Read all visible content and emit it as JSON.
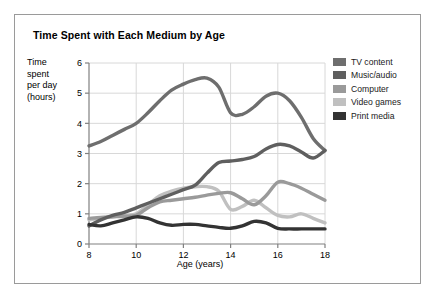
{
  "figure": {
    "title": "Time Spent with Each Medium by Age",
    "border_color": "#9a9a9a",
    "background": "#ffffff"
  },
  "chart_data": {
    "type": "line",
    "title": "Time Spent with Each Medium by Age",
    "xlabel": "Age (years)",
    "ylabel": "Time spent per day (hours)",
    "ylabel_lines": [
      "Time",
      "spent",
      "per day",
      "(hours)"
    ],
    "xlim": [
      8,
      18
    ],
    "ylim": [
      0,
      6
    ],
    "xticks": [
      8,
      10,
      12,
      14,
      16,
      18
    ],
    "yticks": [
      0,
      1,
      2,
      3,
      4,
      5,
      6
    ],
    "xtick_labels": [
      "8",
      "10",
      "12",
      "14",
      "16",
      "18"
    ],
    "ytick_labels": [
      "0",
      "1",
      "2",
      "3",
      "4",
      "5",
      "6"
    ],
    "grid": true,
    "grid_color": "#d8d8d8",
    "axis_color": "#808080",
    "legend_position": "right",
    "x": [
      8,
      8.5,
      9,
      9.5,
      10,
      10.5,
      11,
      11.5,
      12,
      12.5,
      13,
      13.5,
      14,
      14.5,
      15,
      15.5,
      16,
      16.5,
      17,
      17.5,
      18
    ],
    "series": [
      {
        "name": "TV content",
        "color": "#6e6e6e",
        "values": [
          3.25,
          3.4,
          3.6,
          3.8,
          4.0,
          4.35,
          4.75,
          5.1,
          5.3,
          5.45,
          5.5,
          5.2,
          4.35,
          4.3,
          4.55,
          4.9,
          5.0,
          4.75,
          4.2,
          3.5,
          3.1
        ]
      },
      {
        "name": "Music/audio",
        "color": "#5f5f5f",
        "values": [
          0.6,
          0.8,
          0.95,
          1.05,
          1.2,
          1.35,
          1.5,
          1.65,
          1.8,
          1.95,
          2.35,
          2.7,
          2.75,
          2.8,
          2.9,
          3.15,
          3.3,
          3.25,
          3.05,
          2.85,
          3.1
        ]
      },
      {
        "name": "Computer",
        "color": "#9a9a9a",
        "values": [
          0.85,
          0.88,
          0.9,
          0.92,
          0.95,
          1.2,
          1.4,
          1.45,
          1.5,
          1.55,
          1.62,
          1.68,
          1.7,
          1.5,
          1.3,
          1.6,
          2.05,
          2.0,
          1.85,
          1.65,
          1.45
        ]
      },
      {
        "name": "Video games",
        "color": "#c0c0c0",
        "values": [
          0.8,
          0.85,
          0.9,
          0.95,
          1.0,
          1.3,
          1.6,
          1.75,
          1.85,
          1.9,
          1.9,
          1.75,
          1.15,
          1.25,
          1.45,
          1.2,
          0.95,
          0.9,
          1.0,
          0.85,
          0.7
        ]
      },
      {
        "name": "Print media",
        "color": "#333333",
        "values": [
          0.65,
          0.6,
          0.7,
          0.8,
          0.9,
          0.85,
          0.7,
          0.62,
          0.65,
          0.65,
          0.6,
          0.55,
          0.52,
          0.6,
          0.75,
          0.7,
          0.52,
          0.5,
          0.5,
          0.5,
          0.5
        ]
      }
    ]
  },
  "legend": {
    "items": [
      {
        "label": "TV content",
        "color": "#6e6e6e"
      },
      {
        "label": "Music/audio",
        "color": "#5f5f5f"
      },
      {
        "label": "Computer",
        "color": "#9a9a9a"
      },
      {
        "label": "Video games",
        "color": "#c0c0c0"
      },
      {
        "label": "Print media",
        "color": "#333333"
      }
    ]
  }
}
